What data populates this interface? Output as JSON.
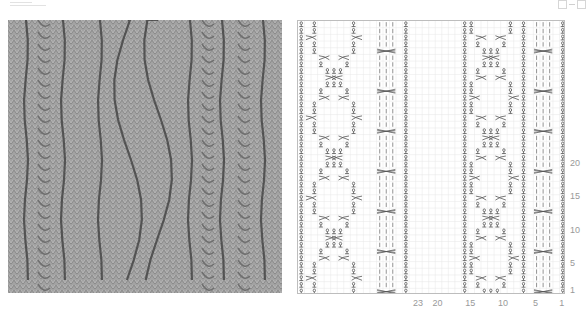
{
  "legend_icons": [
    "empty-square-icon",
    "dash-icon",
    "empty-square-icon"
  ],
  "photo": {
    "alt": "knitted cable swatch photo",
    "background": "#9a9a9a"
  },
  "chart_data": {
    "type": "table",
    "title": "",
    "grid": {
      "columns": 41,
      "rows": 41,
      "grid_color": "#e6e6e6",
      "border_color": "#bdbdbd"
    },
    "row_labels": [
      {
        "label": "20",
        "row": 20
      },
      {
        "label": "15",
        "row": 15
      },
      {
        "label": "10",
        "row": 10
      },
      {
        "label": "5",
        "row": 5
      },
      {
        "label": "1",
        "row": 1
      }
    ],
    "column_labels": [
      {
        "label": "23",
        "col": 23
      },
      {
        "label": "20",
        "col": 20
      },
      {
        "label": "15",
        "col": 15
      },
      {
        "label": "10",
        "col": 10
      },
      {
        "label": "5",
        "col": 5
      },
      {
        "label": "1",
        "col": 1
      }
    ],
    "symbols": {
      "twisted_purl": "twisted stitch (ℓ-like glyph)",
      "knit": "vertical bar",
      "cable": "crossed cable across 4 stitches",
      "cross_left": "left cross over 2",
      "cross_right": "right cross over 2"
    },
    "columns_layout": {
      "twisted_cols": [
        1,
        7,
        16,
        25,
        41
      ],
      "cable_panels": [
        {
          "from": 2,
          "to": 6
        },
        {
          "from": 26,
          "to": 30
        }
      ],
      "cable_cross_rows": [
        1,
        7,
        13,
        19,
        25,
        31,
        37
      ],
      "diamond_panels": [
        {
          "from": 8,
          "to": 15
        },
        {
          "from": 31,
          "to": 40
        }
      ]
    }
  }
}
